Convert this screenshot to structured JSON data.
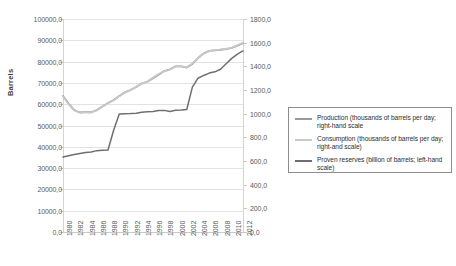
{
  "chart_data": {
    "type": "line",
    "title": "",
    "xlabel": "",
    "ylabel": "Barrels",
    "y2label": "",
    "grid": true,
    "legend_position": "right",
    "x": [
      1980,
      1981,
      1982,
      1983,
      1984,
      1985,
      1986,
      1987,
      1988,
      1989,
      1990,
      1991,
      1992,
      1993,
      1994,
      1995,
      1996,
      1997,
      1998,
      1999,
      2000,
      2001,
      2002,
      2003,
      2004,
      2005,
      2006,
      2007,
      2008,
      2009,
      2010,
      2011,
      2012
    ],
    "xtick_labels": [
      "1980",
      "1982",
      "1984",
      "1986",
      "1988",
      "1990",
      "1992",
      "1994",
      "1996",
      "1998",
      "2000",
      "2002",
      "2004",
      "2006",
      "2008",
      "2010",
      "2012"
    ],
    "ylim": [
      0,
      100000
    ],
    "ytick_labels": [
      "0,0",
      "10000,0",
      "20000,0",
      "30000,0",
      "40000,0",
      "50000,0",
      "60000,0",
      "70000,0",
      "80000,0",
      "90000,0",
      "100000,0"
    ],
    "ytick_values": [
      0,
      10000,
      20000,
      30000,
      40000,
      50000,
      60000,
      70000,
      80000,
      90000,
      100000
    ],
    "y2lim": [
      0,
      1800
    ],
    "y2tick_labels": [
      "0,0",
      "200,0",
      "400,0",
      "600,0",
      "800,0",
      "1000,0",
      "1200,0",
      "1400,0",
      "1600,0",
      "1800,0"
    ],
    "y2tick_values": [
      0,
      200,
      400,
      600,
      800,
      1000,
      1200,
      1400,
      1600,
      1800
    ],
    "series": [
      {
        "name": "Production (thousands of barrels per day; right-hand scale",
        "axis": "right",
        "color": "#9a9a9a",
        "values": [
          1150,
          1085,
          1030,
          1010,
          1015,
          1012,
          1030,
          1060,
          1090,
          1115,
          1150,
          1180,
          1200,
          1225,
          1255,
          1270,
          1300,
          1330,
          1360,
          1375,
          1400,
          1400,
          1390,
          1420,
          1470,
          1510,
          1530,
          1535,
          1540,
          1545,
          1555,
          1575,
          1595
        ]
      },
      {
        "name": "Consumption (thousands of barrels per day; right-and scale)",
        "axis": "right",
        "color": "#c9c9c9",
        "values": [
          1145,
          1080,
          1028,
          1008,
          1012,
          1010,
          1028,
          1058,
          1088,
          1112,
          1148,
          1178,
          1198,
          1228,
          1252,
          1272,
          1305,
          1335,
          1358,
          1372,
          1398,
          1402,
          1392,
          1425,
          1468,
          1508,
          1528,
          1538,
          1542,
          1548,
          1558,
          1578,
          1600
        ]
      },
      {
        "name": "Proven reserves (billion of barrels; left-hand scale)",
        "axis": "left",
        "color": "#6f6f6f",
        "values": [
          35200,
          35800,
          36400,
          36900,
          37300,
          37600,
          38200,
          38400,
          38500,
          47800,
          55400,
          55500,
          55600,
          55800,
          56200,
          56400,
          56600,
          57000,
          57100,
          56600,
          57200,
          57300,
          57500,
          68000,
          72200,
          73500,
          74600,
          75200,
          76400,
          79000,
          81500,
          83500,
          85000
        ]
      }
    ]
  },
  "axis": {
    "y_title": "Barrels"
  }
}
